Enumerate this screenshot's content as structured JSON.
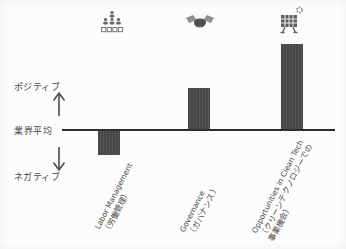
{
  "chart_data": {
    "type": "bar",
    "title": "",
    "y_axis": {
      "positive_label": "ポジティブ",
      "baseline_label": "業界平均",
      "negative_label": "ネガティブ"
    },
    "value_note": "qualitative ESG key-issue scores relative to industry average (業界平均 = 0); normalized so tallest bar = 1.0",
    "categories": [
      {
        "name_en": "Labor Management",
        "name_ja": "（労働管理）",
        "icon": "organization-people-icon",
        "value": -0.28
      },
      {
        "name_en": "Governance",
        "name_ja": "（ガバナンス）",
        "icon": "handshake-icon",
        "value": 0.49
      },
      {
        "name_en": "Opportunities in Clean Tech",
        "name_ja": "（クリーンテクノロジーでの事業機会）",
        "icon": "solar-panel-icon",
        "value": 1.0
      }
    ],
    "grid": false,
    "legend": null,
    "bar_color": "#4c4c4c"
  },
  "colors": {
    "bar": "#4c4c4c",
    "axis_line": "#2e2e2e",
    "text": "#474747",
    "icon_gray": "#666666",
    "background": "#fcfcfc"
  }
}
